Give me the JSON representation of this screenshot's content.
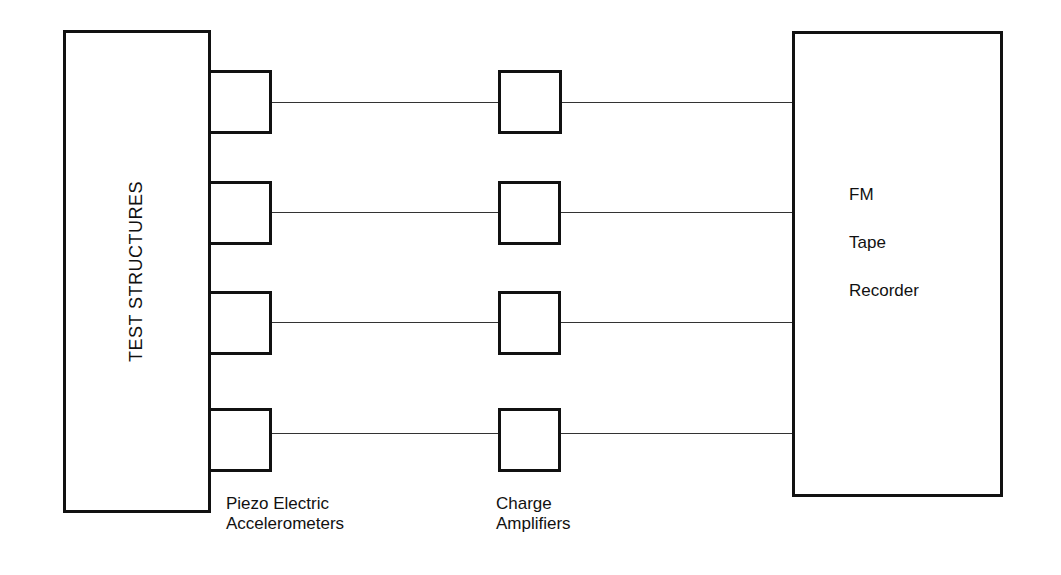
{
  "diagram": {
    "test_structures": {
      "label": "TEST STRUCTURES"
    },
    "accelerometers": {
      "label_line1": "Piezo Electric",
      "label_line2": "Accelerometers",
      "count": 4
    },
    "charge_amplifiers": {
      "label_line1": "Charge",
      "label_line2": "Amplifiers",
      "count": 4
    },
    "recorder": {
      "line1": "FM",
      "line2": "Tape",
      "line3": "Recorder"
    }
  },
  "colors": {
    "stroke": "#111111",
    "background": "#ffffff"
  }
}
